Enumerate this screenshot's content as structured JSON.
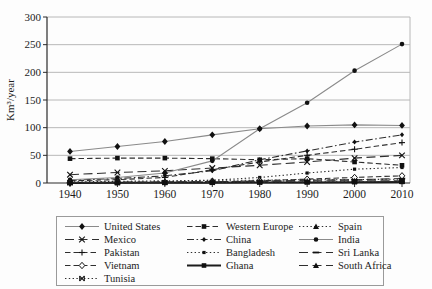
{
  "chart_data": {
    "type": "line",
    "title": "",
    "xlabel": "",
    "ylabel": "Km³/year",
    "x": [
      1940,
      1950,
      1960,
      1970,
      1980,
      1990,
      2000,
      2010
    ],
    "ylim": [
      0,
      300
    ],
    "yticks": [
      0,
      50,
      100,
      150,
      200,
      250,
      300
    ],
    "grid": "horizontal",
    "legend_position": "bottom-box",
    "series": [
      {
        "name": "United States",
        "marker": "diamond",
        "line": "solid",
        "color": "#8a8a8a",
        "values": [
          57,
          66,
          75,
          87,
          98,
          103,
          105,
          104
        ]
      },
      {
        "name": "Western Europe",
        "marker": "square",
        "line": "dashed",
        "color": "#2e2e2e",
        "values": [
          44,
          45,
          45,
          44,
          42,
          44,
          38,
          32
        ]
      },
      {
        "name": "Spain",
        "marker": "triangle",
        "line": "dotted",
        "color": "#2e2e2e",
        "values": [
          2,
          3,
          4,
          5,
          5,
          6,
          6,
          7
        ]
      },
      {
        "name": "Mexico",
        "marker": "x",
        "line": "longdash",
        "color": "#2e2e2e",
        "values": [
          15,
          19,
          22,
          27,
          32,
          38,
          45,
          50
        ]
      },
      {
        "name": "China",
        "marker": "small-diamond",
        "line": "dashdot",
        "color": "#2e2e2e",
        "values": [
          5,
          8,
          13,
          22,
          42,
          58,
          74,
          87
        ]
      },
      {
        "name": "India",
        "marker": "circle",
        "line": "solid",
        "color": "#8a8a8a",
        "values": [
          6,
          10,
          18,
          40,
          98,
          145,
          203,
          251
        ]
      },
      {
        "name": "Pakistan",
        "marker": "plus",
        "line": "dashed",
        "color": "#2e2e2e",
        "values": [
          4,
          6,
          10,
          24,
          38,
          50,
          61,
          73
        ]
      },
      {
        "name": "Bangladesh",
        "marker": "small-square",
        "line": "dotted",
        "color": "#2e2e2e",
        "values": [
          1,
          1,
          2,
          5,
          10,
          18,
          25,
          28
        ]
      },
      {
        "name": "Sri Lanka",
        "marker": "dash",
        "line": "longdash",
        "color": "#2e2e2e",
        "values": [
          0.3,
          0.5,
          1,
          2,
          3,
          5,
          6,
          8
        ]
      },
      {
        "name": "Vietnam",
        "marker": "open-diamond",
        "line": "dashed",
        "color": "#2e2e2e",
        "values": [
          0.3,
          0.5,
          1,
          2,
          4,
          7,
          10,
          13
        ]
      },
      {
        "name": "Ghana",
        "marker": "square",
        "line": "solid-thick",
        "color": "#1c1c1c",
        "values": [
          0.2,
          0.3,
          0.4,
          0.6,
          0.8,
          1,
          1.5,
          2
        ]
      },
      {
        "name": "South Africa",
        "marker": "triangle",
        "line": "longdash",
        "color": "#2e2e2e",
        "values": [
          1,
          1.5,
          2,
          2.5,
          3,
          3.5,
          4,
          4
        ]
      },
      {
        "name": "Tunisia",
        "marker": "x-bar",
        "line": "dotted",
        "color": "#2e2e2e",
        "values": [
          0.3,
          0.5,
          0.8,
          1,
          1.5,
          2,
          2.5,
          3
        ]
      }
    ],
    "colors": {
      "marker": "#111111",
      "gridline": "#b8b8b8",
      "axis": "#2a2a2a",
      "tick_text": "#1c1c1c"
    }
  }
}
